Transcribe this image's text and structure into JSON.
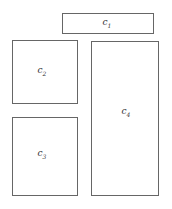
{
  "diagram": {
    "boxes": [
      {
        "id": "c1",
        "label": "c",
        "sub": "1"
      },
      {
        "id": "c2",
        "label": "c",
        "sub": "2"
      },
      {
        "id": "c3",
        "label": "c",
        "sub": "3"
      },
      {
        "id": "c4",
        "label": "c",
        "sub": "4"
      }
    ]
  }
}
